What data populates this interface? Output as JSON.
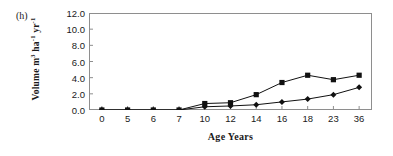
{
  "figure": {
    "panel_label": "(h)",
    "background_color": "#ffffff",
    "axis_color": "#8e8e8e",
    "series_color": "#111111"
  },
  "axis": {
    "y_title_prefix": "Volume m",
    "y_title_sup1": "3",
    "y_title_mid": " ha",
    "y_title_sup2": "-1",
    "y_title_mid2": " yr",
    "y_title_sup3": "-1",
    "y_title_plain": "Volume m3 ha-1 yr-1",
    "x_title": "Age Years"
  },
  "chart_data": {
    "type": "line",
    "title": "(h)",
    "xlabel": "Age Years",
    "ylabel": "Volume m3 ha-1 yr-1",
    "categories": [
      "0",
      "5",
      "6",
      "7",
      "10",
      "12",
      "14",
      "16",
      "18",
      "23",
      "36"
    ],
    "ytick_labels": [
      "0.0",
      "2.0",
      "4.0",
      "6.0",
      "8.0",
      "10.0",
      "12.0"
    ],
    "ytick_values": [
      0,
      2,
      4,
      6,
      8,
      10,
      12
    ],
    "ylim": [
      0,
      12
    ],
    "grid": false,
    "legend": "none",
    "series": [
      {
        "name": "squares",
        "marker": "square",
        "values": [
          0.0,
          0.0,
          0.0,
          0.0,
          0.8,
          0.9,
          1.9,
          3.4,
          4.3,
          3.75,
          4.3
        ]
      },
      {
        "name": "diamonds",
        "marker": "diamond",
        "values": [
          0.0,
          0.0,
          0.0,
          0.0,
          0.4,
          0.5,
          0.65,
          1.0,
          1.35,
          1.9,
          2.8
        ]
      }
    ]
  }
}
